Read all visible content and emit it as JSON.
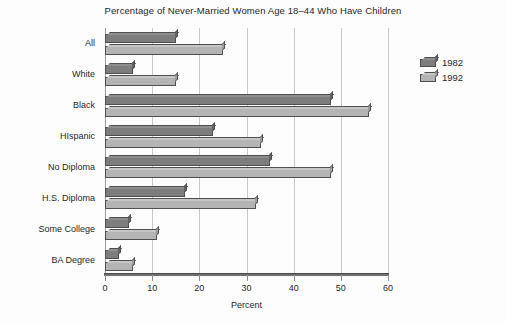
{
  "chart_data": {
    "type": "bar",
    "orientation": "horizontal",
    "title": "Percentage of Never-Married Women Age 18–44 Who Have Children",
    "xlabel": "Percent",
    "ylabel": "",
    "xlim": [
      0,
      60
    ],
    "xticks": [
      0,
      10,
      20,
      30,
      40,
      50,
      60
    ],
    "xtick_labels": [
      "0",
      "10",
      "20",
      "30",
      "40",
      "50",
      "60"
    ],
    "grid": true,
    "grid_axis": "x",
    "legend_position": "right",
    "categories": [
      "All",
      "White",
      "Black",
      "HIspanic",
      "No Diploma",
      "H.S. Diploma",
      "Some College",
      "BA Degree"
    ],
    "series": [
      {
        "name": "1982",
        "color": "#7d7d7d",
        "values": [
          15,
          6,
          48,
          23,
          35,
          17,
          5,
          3
        ]
      },
      {
        "name": "1992",
        "color": "#b4b4b4",
        "values": [
          25,
          15,
          56,
          33,
          48,
          32,
          11,
          6
        ]
      }
    ]
  },
  "legend": {
    "entries": [
      {
        "label": "1982",
        "series": "1982"
      },
      {
        "label": "1992",
        "series": "1992"
      }
    ]
  },
  "colors": {
    "series_1982": "#7d7d7d",
    "series_1992": "#b4b4b4",
    "axis": "#6f6f6f",
    "gridline": "#c8c8c8",
    "text": "#1f1f1f",
    "background": "#fdfdfd"
  }
}
